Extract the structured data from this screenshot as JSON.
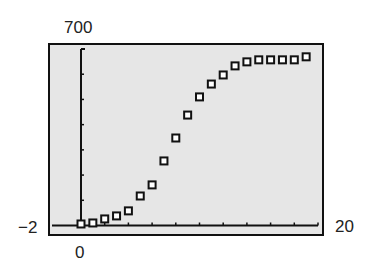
{
  "window_labels": {
    "ymax": "700",
    "ymin": "−2",
    "xmin": "0",
    "xmax": "20"
  },
  "chart_data": {
    "type": "scatter",
    "title": "",
    "xlabel": "",
    "ylabel": "",
    "xlim": [
      0,
      20
    ],
    "ylim": [
      -2,
      700
    ],
    "x_tick_step": 2,
    "y_tick_step": 100,
    "grid": false,
    "marker": "hollow-square",
    "x": [
      0,
      1,
      2,
      3,
      4,
      5,
      6,
      7,
      8,
      9,
      10,
      11,
      12,
      13,
      14,
      15,
      16,
      17,
      18,
      19
    ],
    "y": [
      6,
      10,
      26,
      38,
      58,
      117,
      161,
      256,
      347,
      438,
      510,
      561,
      597,
      633,
      649,
      657,
      657,
      657,
      657,
      669
    ]
  }
}
